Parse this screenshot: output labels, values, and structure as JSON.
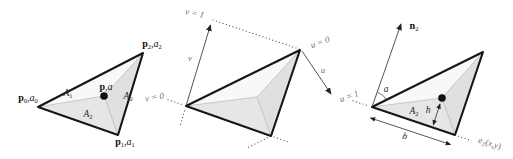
{
  "colors": {
    "background": "#ffffff",
    "triangle_edge": "#161616",
    "subdivision_line": "#b5b5b5",
    "fill_upper_region": "#f8f8f8",
    "fill_lower_region": "#e6e6e6",
    "fill_right_region": "#e0e0e0",
    "axis_label_gray": "#6f6f6f",
    "label_black": "#161616"
  },
  "labels": {
    "left": {
      "p0": [
        {
          "t": "p",
          "f": "b"
        },
        {
          "t": "0",
          "sub": true
        },
        {
          "t": ","
        },
        {
          "t": "a",
          "f": "i"
        },
        {
          "t": "0",
          "sub": true
        }
      ],
      "p2": [
        {
          "t": "p",
          "f": "b"
        },
        {
          "t": "2",
          "sub": true
        },
        {
          "t": ","
        },
        {
          "t": "a",
          "f": "i"
        },
        {
          "t": "2",
          "sub": true
        }
      ],
      "p1": [
        {
          "t": "p",
          "f": "b"
        },
        {
          "t": "1",
          "sub": true
        },
        {
          "t": ","
        },
        {
          "t": "a",
          "f": "i"
        },
        {
          "t": "1",
          "sub": true
        }
      ],
      "p_center": [
        {
          "t": "p",
          "f": "b"
        },
        {
          "t": ","
        },
        {
          "t": "a",
          "f": "i"
        }
      ],
      "A1": [
        {
          "t": "A",
          "f": "i"
        },
        {
          "t": "1",
          "sub": true
        }
      ],
      "A0": [
        {
          "t": "A",
          "f": "i"
        },
        {
          "t": "0",
          "sub": true
        }
      ],
      "A2": [
        {
          "t": "A",
          "f": "i"
        },
        {
          "t": "2",
          "sub": true
        }
      ]
    },
    "middle": {
      "v_eq_1": "v = 1",
      "v_axis": "v",
      "v_eq_0": "v = 0",
      "u_eq_0": "u = 0",
      "u_axis": "u",
      "u_eq_1": "u = 1"
    },
    "right": {
      "n2": [
        {
          "t": "n",
          "f": "b"
        },
        {
          "t": "2",
          "sub": true
        }
      ],
      "angle_a": "a",
      "A2": [
        {
          "t": "A",
          "f": "i"
        },
        {
          "t": "2",
          "sub": true
        }
      ],
      "h": "h",
      "b": "b",
      "e2": [
        {
          "t": "e",
          "f": "i"
        },
        {
          "t": "2",
          "sub": true
        },
        {
          "t": "("
        },
        {
          "t": "x",
          "f": "i"
        },
        {
          "t": ","
        },
        {
          "t": "y",
          "f": "i"
        },
        {
          "t": ")"
        }
      ]
    }
  }
}
